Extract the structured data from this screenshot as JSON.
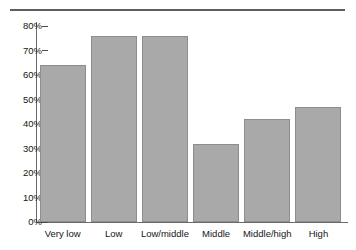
{
  "chart_data": {
    "type": "bar",
    "title": "",
    "xlabel": "",
    "ylabel": "",
    "categories": [
      "Very low",
      "Low",
      "Low/middle",
      "Middle",
      "Middle/high",
      "High"
    ],
    "values": [
      64,
      76,
      76,
      32,
      42,
      47
    ],
    "ylim": [
      0,
      80
    ],
    "ytick_values": [
      0,
      10,
      20,
      30,
      40,
      50,
      60,
      70,
      80
    ],
    "ytick_labels": [
      "0%",
      "10%",
      "20%",
      "30%",
      "40%",
      "50%",
      "60%",
      "70%",
      "80%"
    ],
    "grid": false,
    "legend": null,
    "bar_color": "#a9a9a9",
    "bar_border_color": "#8d8d8d",
    "axis_color": "#6a6a6a",
    "rule_color": "#5b5f63"
  }
}
